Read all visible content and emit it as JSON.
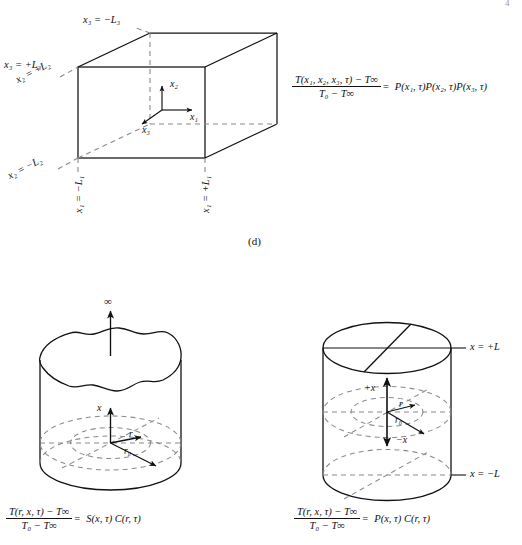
{
  "figure": {
    "caption_d": "(d)",
    "page_number": "4"
  },
  "panel_box": {
    "name": "rectangular-parallelepiped",
    "labels": {
      "x3_neg": "x₃ = −L₃",
      "x3_pos": "x₃ = +L₃",
      "x2_pos": "x₂ = +L₂",
      "x2_neg": "x₂ = −L₂",
      "x1_neg": "x₁ = −L₁",
      "x1_pos": "x₁ = +L₁"
    },
    "axes": {
      "x1": "x₁",
      "x2": "x₂",
      "x3": "x₃"
    },
    "equation": {
      "numerator": "T(x₁, x₂, x₃, τ) − T∞",
      "denominator": "T₀ − T∞",
      "equals": "=",
      "rhs": "P(x₁, τ)P(x₂, τ)P(x₃, τ)"
    }
  },
  "panel_semi_infinite_cylinder": {
    "name": "semi-infinite-cylinder",
    "labels": {
      "infinity": "∞",
      "axis_x": "x",
      "radius_r": "r",
      "radius_r0": "r₀"
    },
    "equation": {
      "numerator": "T(r, x, τ) − T∞",
      "denominator": "T₀ − T∞",
      "equals": "=",
      "rhs": "S(x, τ) C(r, τ)"
    }
  },
  "panel_finite_cylinder": {
    "name": "finite-cylinder",
    "labels": {
      "x_top": "x = +L",
      "x_bottom": "x = −L",
      "plus_x": "+x",
      "minus_x": "−x",
      "radius_r": "r",
      "radius_r0": "r₀"
    },
    "equation": {
      "numerator": "T(r, x, τ) − T∞",
      "denominator": "T₀ − T∞",
      "equals": "=",
      "rhs": "P(x, τ) C(r, τ)"
    }
  },
  "style": {
    "ink": "#111111",
    "background": "#ffffff"
  }
}
